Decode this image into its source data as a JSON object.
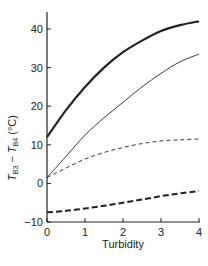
{
  "chart_data": {
    "type": "line",
    "title": "",
    "xlabel": "Turbidity",
    "ylabel": "T_B3 − T_B4 (°C)",
    "ylabel_parts": {
      "t1": "T",
      "s1": "B3",
      "minus": " − ",
      "t2": "T",
      "s2": "B4",
      "unit": " (°C)"
    },
    "xlim": [
      0,
      4
    ],
    "ylim": [
      -10,
      45
    ],
    "x_ticks": [
      0,
      1,
      2,
      3,
      4
    ],
    "x_tick_labels": [
      "0",
      "1",
      "2",
      "3",
      "4"
    ],
    "y_ticks": [
      -10,
      0,
      10,
      20,
      30,
      40
    ],
    "y_tick_labels": [
      "−10",
      "0",
      "10",
      "20",
      "30",
      "40"
    ],
    "grid": false,
    "legend": null,
    "x": [
      0,
      0.5,
      1,
      1.5,
      2,
      2.5,
      3,
      3.5,
      4
    ],
    "series": [
      {
        "name": "thick-solid",
        "style": "solid",
        "width": 2.2,
        "values": [
          12,
          19,
          25,
          30,
          34,
          37,
          39.5,
          41,
          42
        ]
      },
      {
        "name": "thin-solid",
        "style": "solid",
        "width": 0.9,
        "values": [
          1.5,
          7,
          12.5,
          17,
          21,
          25,
          28.5,
          31.5,
          33.5
        ]
      },
      {
        "name": "thin-dashed",
        "style": "dashed",
        "width": 0.9,
        "values": [
          1.5,
          4,
          6.3,
          8,
          9.3,
          10.3,
          11,
          11.3,
          11.5
        ]
      },
      {
        "name": "thick-dashed",
        "style": "dashed",
        "width": 2.0,
        "values": [
          -7.5,
          -7.1,
          -6.5,
          -5.8,
          -5,
          -4.2,
          -3.3,
          -2.6,
          -2
        ]
      }
    ]
  }
}
